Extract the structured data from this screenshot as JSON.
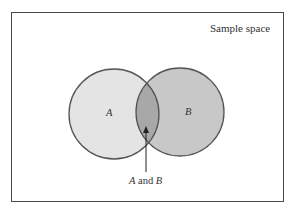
{
  "diagram": {
    "title": "Sample space",
    "type": "venn",
    "sets": [
      {
        "id": "A",
        "label": "A",
        "fill": "#e4e4e4",
        "cx": 114,
        "cy": 114,
        "r": 45
      },
      {
        "id": "B",
        "label": "B",
        "fill": "#c8c8c8",
        "cx": 180,
        "cy": 112,
        "r": 44
      }
    ],
    "intersection": {
      "fill": "#a8a8a8",
      "label_a": "A",
      "label_and": " and ",
      "label_b": "B"
    },
    "stroke_color": "#555555",
    "frame_color": "#4a4a4a"
  }
}
